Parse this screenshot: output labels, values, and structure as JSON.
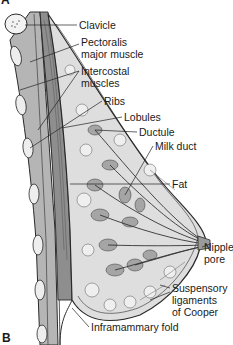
{
  "figure": {
    "panel_top_partial": "A",
    "panel_label": "B"
  },
  "labels": [
    {
      "id": "clavicle",
      "text": "Clavicle",
      "x": 79,
      "y": 20
    },
    {
      "id": "pectoralis-1",
      "text": "Pectoralis",
      "x": 81,
      "y": 37
    },
    {
      "id": "pectoralis-2",
      "text": "major muscle",
      "x": 81,
      "y": 49
    },
    {
      "id": "intercostal-1",
      "text": "Intercostal",
      "x": 81,
      "y": 66
    },
    {
      "id": "intercostal-2",
      "text": "muscles",
      "x": 81,
      "y": 78
    },
    {
      "id": "ribs",
      "text": "Ribs",
      "x": 104,
      "y": 96
    },
    {
      "id": "lobules",
      "text": "Lobules",
      "x": 124,
      "y": 112
    },
    {
      "id": "ductule",
      "text": "Ductule",
      "x": 139,
      "y": 127
    },
    {
      "id": "milk-duct",
      "text": "Milk duct",
      "x": 155,
      "y": 141
    },
    {
      "id": "fat",
      "text": "Fat",
      "x": 172,
      "y": 179
    },
    {
      "id": "nipple-1",
      "text": "Nipple",
      "x": 204,
      "y": 242
    },
    {
      "id": "nipple-2",
      "text": "pore",
      "x": 204,
      "y": 254
    },
    {
      "id": "cooper-1",
      "text": "Suspensory",
      "x": 172,
      "y": 283
    },
    {
      "id": "cooper-2",
      "text": "ligaments",
      "x": 172,
      "y": 295
    },
    {
      "id": "cooper-3",
      "text": "of Cooper",
      "x": 172,
      "y": 307
    },
    {
      "id": "inframammary",
      "text": "Inframammary fold",
      "x": 91,
      "y": 322
    }
  ],
  "colors": {
    "outline": "#2a2a2a",
    "tissue_fill": "#d6d6d6",
    "muscle_fill": "#9a9a9a",
    "fat_fill": "#e4e4e4",
    "lobule_fill": "#a8a8a8",
    "background": "#ffffff"
  }
}
